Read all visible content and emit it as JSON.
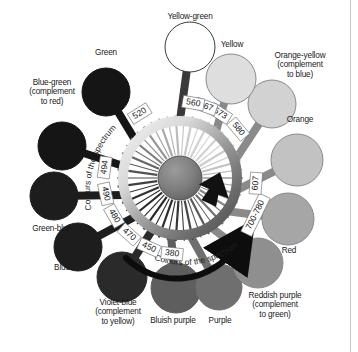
{
  "figure": {
    "curved_text_left": "Colours of the spectrum",
    "curved_text_right": "Colours of the spectrum",
    "background": "#ffffff",
    "ink": "#1a1a1a"
  },
  "colours": [
    {
      "id": "yellow-green",
      "label": "Yellow-green",
      "fill": "#ffffff",
      "stroke": "#3a3a3a",
      "cx": 190,
      "cy": 47,
      "r": 25,
      "angle": -90,
      "label_x": 190,
      "label_y": 16,
      "label_align": "center"
    },
    {
      "id": "green",
      "label": "Green",
      "fill": "#151515",
      "stroke": "#151515",
      "cx": 106,
      "cy": 92,
      "r": 24,
      "angle": -140,
      "label_x": 106,
      "label_y": 52,
      "label_align": "center"
    },
    {
      "id": "blue-green",
      "label": "Blue-green\n(complement\nto red)",
      "fill": "#151515",
      "stroke": "#151515",
      "cx": 62,
      "cy": 146,
      "r": 24,
      "angle": -168,
      "label_x": 52,
      "label_y": 82,
      "label_align": "center"
    },
    {
      "id": "green-blue",
      "label": "Green-blue",
      "fill": "#1d1d1d",
      "stroke": "#1d1d1d",
      "cx": 54,
      "cy": 196,
      "r": 24,
      "angle": 163,
      "label_x": 52,
      "label_y": 228,
      "label_align": "center"
    },
    {
      "id": "blue",
      "label": "Blue",
      "fill": "#1d1d1d",
      "stroke": "#1d1d1d",
      "cx": 78,
      "cy": 247,
      "r": 24,
      "angle": 139,
      "label_x": 62,
      "label_y": 267,
      "label_align": "center"
    },
    {
      "id": "violet-blue",
      "label": "Violet-blue\n(complement\nto yellow)",
      "fill": "#2a2a2a",
      "stroke": "#2a2a2a",
      "cx": 122,
      "cy": 277,
      "r": 25,
      "angle": 118,
      "label_x": 118,
      "label_y": 302,
      "label_align": "center"
    },
    {
      "id": "bluish-purple",
      "label": "Bluish purple",
      "fill": "#5e5e5e",
      "stroke": "#5e5e5e",
      "cx": 176,
      "cy": 288,
      "r": 25,
      "angle": 99,
      "label_x": 173,
      "label_y": 320,
      "label_align": "center"
    },
    {
      "id": "purple",
      "label": "Purple",
      "fill": "#6f6f6f",
      "stroke": "#6f6f6f",
      "cx": 219,
      "cy": 287,
      "r": 23,
      "angle": 80,
      "label_x": 220,
      "label_y": 320,
      "label_align": "center"
    },
    {
      "id": "reddish-purple",
      "label": "Reddish purple\n(complement\nto green)",
      "fill": "#8f8f8f",
      "stroke": "#8a8a8a",
      "cx": 258,
      "cy": 263,
      "r": 25,
      "angle": 58,
      "label_x": 275,
      "label_y": 295,
      "label_align": "center"
    },
    {
      "id": "red",
      "label": "Red",
      "fill": "#a6a6a6",
      "stroke": "#8a8a8a",
      "cx": 288,
      "cy": 219,
      "r": 26,
      "angle": 35,
      "label_x": 289,
      "label_y": 250,
      "label_align": "center"
    },
    {
      "id": "orange",
      "label": "Orange",
      "fill": "#c2c2c2",
      "stroke": "#8a8a8a",
      "cx": 297,
      "cy": 160,
      "r": 26,
      "angle": 12,
      "label_x": 300,
      "label_y": 119,
      "label_align": "center"
    },
    {
      "id": "orange-yellow",
      "label": "Orange-yellow\n(complement\nto blue)",
      "fill": "#d2d2d2",
      "stroke": "#8a8a8a",
      "cx": 272,
      "cy": 104,
      "r": 24,
      "angle": -18,
      "label_x": 300,
      "label_y": 55,
      "label_align": "center"
    },
    {
      "id": "yellow",
      "label": "Yellow",
      "fill": "#dedede",
      "stroke": "#8a8a8a",
      "cx": 231,
      "cy": 79,
      "r": 25,
      "angle": -52,
      "label_x": 232,
      "label_y": 44,
      "label_align": "center"
    }
  ],
  "wavelengths": [
    {
      "value": "520",
      "angle": -122
    },
    {
      "value": "494",
      "angle": -172
    },
    {
      "value": "490",
      "angle": 168
    },
    {
      "value": "480",
      "angle": 150
    },
    {
      "value": "470",
      "angle": 132
    },
    {
      "value": "450",
      "angle": 114
    },
    {
      "value": "380",
      "angle": 96
    },
    {
      "value": "700-780",
      "angle": 26
    },
    {
      "value": "607",
      "angle": 4
    },
    {
      "value": "580",
      "angle": -40
    },
    {
      "value": "573",
      "angle": -58
    },
    {
      "value": "567",
      "angle": -70
    },
    {
      "value": "560",
      "angle": -80
    }
  ],
  "hub": {
    "center_x": 180,
    "center_y": 178,
    "hub_radius": 22,
    "ring_inner": 52,
    "ring_outer": 62,
    "ring_light": "#e8e8e8",
    "ring_dark": "#4a4a4a"
  },
  "arrow": {
    "name": "direction-arrow",
    "description": "black curved arrow sweeping clockwise to the red end"
  }
}
